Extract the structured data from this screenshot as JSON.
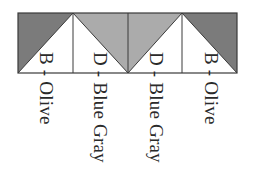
{
  "diagram": {
    "colors": {
      "olive_fill": "#7b7b7b",
      "blue_gray_fill": "#ababab",
      "background": "#ffffff",
      "stroke": "#3a3a3a",
      "text": "#2a2a2a"
    },
    "blocks": [
      {
        "id": "B",
        "label": "B - Olive",
        "shade": "dark",
        "triangle": "top-left"
      },
      {
        "id": "D",
        "label": "D - Blue Gray",
        "shade": "light",
        "triangle": "top-right"
      },
      {
        "id": "D",
        "label": "D - Blue Gray",
        "shade": "light",
        "triangle": "top-left"
      },
      {
        "id": "B",
        "label": "B - Olive",
        "shade": "dark",
        "triangle": "top-right"
      }
    ]
  }
}
